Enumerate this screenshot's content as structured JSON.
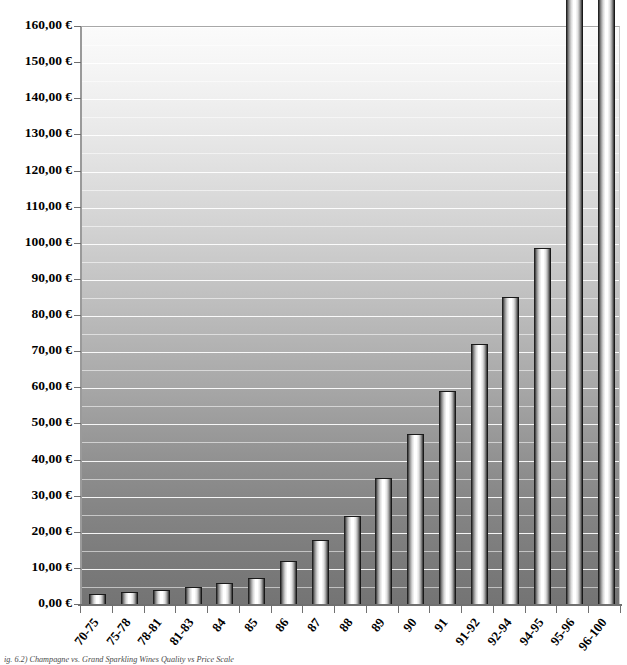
{
  "chart_data": {
    "type": "bar",
    "title": "",
    "xlabel": "",
    "ylabel": "",
    "ylim": [
      0,
      160
    ],
    "ytick_step": 10,
    "grid": true,
    "legend": null,
    "currency_symbol": "€",
    "value_format": "0,00 €",
    "note": "The two rightmost bars are clipped by the top of the plot area; their values exceed the 160,00 € axis maximum.",
    "categories": [
      "70-75",
      "75-78",
      "78-81",
      "81-83",
      "84",
      "85",
      "86",
      "87",
      "88",
      "89",
      "90",
      "91",
      "91-92",
      "92-94",
      "94-95",
      "95-96",
      "96-100"
    ],
    "values": [
      2.8,
      3.2,
      3.8,
      4.7,
      5.8,
      7.3,
      12.0,
      17.8,
      24.5,
      35.0,
      47.0,
      59.0,
      72.0,
      85.0,
      98.5,
      175.0,
      178.0
    ],
    "clipped": [
      false,
      false,
      false,
      false,
      false,
      false,
      false,
      false,
      false,
      false,
      false,
      false,
      false,
      false,
      false,
      true,
      true
    ],
    "ytick_labels": [
      "0,00 €",
      "10,00 €",
      "20,00 €",
      "30,00 €",
      "40,00 €",
      "50,00 €",
      "60,00 €",
      "70,00 €",
      "80,00 €",
      "90,00 €",
      "100,00 €",
      "110,00 €",
      "120,00 €",
      "130,00 €",
      "140,00 €",
      "150,00 €",
      "160,00 €"
    ],
    "ytick_values": [
      0,
      10,
      20,
      30,
      40,
      50,
      60,
      70,
      80,
      90,
      100,
      110,
      120,
      130,
      140,
      150,
      160
    ]
  },
  "caption": {
    "text": "ig. 6.2) Champagne vs. Grand Sparkling Wines Quality vs Price Scale"
  },
  "style": {
    "bar_highlight": "#ffffff",
    "bar_edge": "#000000",
    "gridline_color": "#ffffff",
    "axis_color": "#707070",
    "plot_top_color": "#fbfbfb",
    "plot_bottom_color": "#747474"
  }
}
